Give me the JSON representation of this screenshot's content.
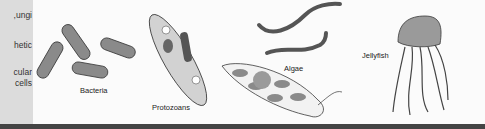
{
  "sidebar": {
    "lines": [
      "ungi,",
      "hetic",
      "cular",
      "cells"
    ]
  },
  "figure": {
    "labels": {
      "bacteria": "Bacteria",
      "protozoans": "Protozoans",
      "algae": "Algae",
      "jellyfish": "Jellyfish"
    }
  },
  "colors": {
    "organism_fill": "#8a8a8a",
    "outline": "#3a3a3a",
    "sidebar": "#dcdcdc",
    "bottom_bar": "#444444"
  }
}
